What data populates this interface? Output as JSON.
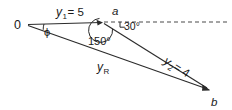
{
  "figure": {
    "type": "vector-diagram",
    "background_color": "#ffffff",
    "line_color": "#2b2b2b",
    "dashed_line_color": "#4a4a4a",
    "text_color": "#1a1a1a",
    "points": {
      "origin": {
        "label": "0",
        "x": 27,
        "y": 24
      },
      "a": {
        "label": "a",
        "x": 103,
        "y": 23
      },
      "b": {
        "label": "b",
        "x": 210,
        "y": 90
      }
    },
    "vectors": [
      {
        "name": "y1",
        "label_main": "y",
        "label_sub": "1",
        "label_value": "= 5",
        "label_full": "y₁ = 5",
        "magnitude": 5,
        "from": "origin",
        "to": "a"
      },
      {
        "name": "y2",
        "label_main": "y",
        "label_sub": "2",
        "label_value": "= 4",
        "label_full": "y₂ = 4",
        "magnitude": 4,
        "from": "a",
        "to": "b"
      },
      {
        "name": "yR",
        "label_main": "y",
        "label_sub": "R",
        "label_value": "",
        "label_full": "yR",
        "from": "origin",
        "to": "b"
      }
    ],
    "angles": [
      {
        "name": "phi",
        "label": "ϕ",
        "at": "origin"
      },
      {
        "name": "angle-150",
        "label": "150°",
        "at": "a"
      },
      {
        "name": "angle-30",
        "label": "30°",
        "at": "a"
      }
    ],
    "dashed_reference_line": {
      "name": "horizontal-reference",
      "from_x": 103,
      "to_x": 229,
      "y": 22
    }
  }
}
